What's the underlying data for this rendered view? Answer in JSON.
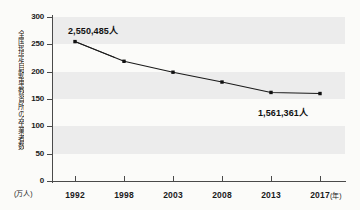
{
  "figure": {
    "top_fragment": "",
    "background_color": "#fbfbf9",
    "band_color": "#ececec",
    "line_color": "#1a1a1a",
    "marker_color": "#111111"
  },
  "chart_data": {
    "type": "line",
    "title": "",
    "xlabel": "年",
    "ylabel": "全国指定自動車教習所の卒業者数",
    "y_unit": "(万人)",
    "x_unit": "(年)",
    "categories": [
      "1992",
      "1998",
      "2003",
      "2008",
      "2013",
      "2017"
    ],
    "values": [
      255,
      219,
      199,
      181,
      162,
      160
    ],
    "ylim": [
      0,
      300
    ],
    "yticks": [
      0,
      50,
      100,
      150,
      200,
      250,
      300
    ],
    "ytick_labels": [
      "0",
      "50",
      "100",
      "150",
      "200",
      "250",
      "300"
    ],
    "grid": false,
    "banded_rows": [
      [
        50,
        100
      ],
      [
        150,
        200
      ],
      [
        250,
        300
      ]
    ],
    "legend": null,
    "annotations": [
      {
        "text": "2,550,485人",
        "point_index": 0
      },
      {
        "text": "1,561,361人",
        "point_index": 5
      }
    ]
  }
}
